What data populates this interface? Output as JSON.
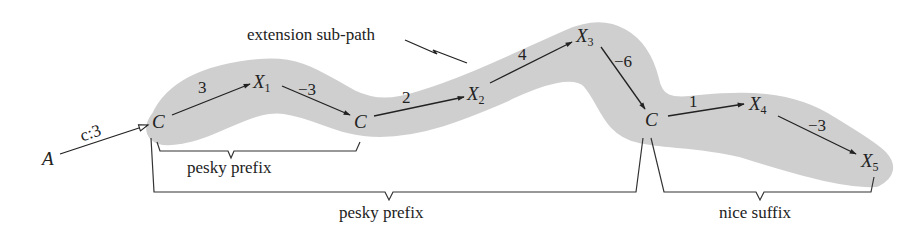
{
  "diagram": {
    "highlight_color": "#c9c9c9",
    "callout": {
      "text": "extension sub-path"
    },
    "nodes": {
      "A": {
        "label": "A"
      },
      "C1": {
        "label": "C"
      },
      "X1": {
        "label": "X",
        "sub": "1"
      },
      "C2": {
        "label": "C"
      },
      "X2": {
        "label": "X",
        "sub": "2"
      },
      "X3": {
        "label": "X",
        "sub": "3"
      },
      "C3": {
        "label": "C"
      },
      "X4": {
        "label": "X",
        "sub": "4"
      },
      "X5": {
        "label": "X",
        "sub": "5"
      }
    },
    "edges": [
      {
        "from": "A",
        "to": "C1",
        "label": "c:3",
        "style": "open-arrow"
      },
      {
        "from": "C1",
        "to": "X1",
        "label": "3"
      },
      {
        "from": "X1",
        "to": "C2",
        "label": "−3"
      },
      {
        "from": "C2",
        "to": "X2",
        "label": "2"
      },
      {
        "from": "X2",
        "to": "X3",
        "label": "4"
      },
      {
        "from": "X3",
        "to": "C3",
        "label": "−6"
      },
      {
        "from": "C3",
        "to": "X4",
        "label": "1"
      },
      {
        "from": "X4",
        "to": "X5",
        "label": "−3"
      }
    ],
    "braces": [
      {
        "label": "pesky prefix",
        "span": "C1 to C2"
      },
      {
        "label": "pesky prefix",
        "span": "C1 to C3"
      },
      {
        "label": "nice suffix",
        "span": "C3 to X5"
      }
    ]
  }
}
